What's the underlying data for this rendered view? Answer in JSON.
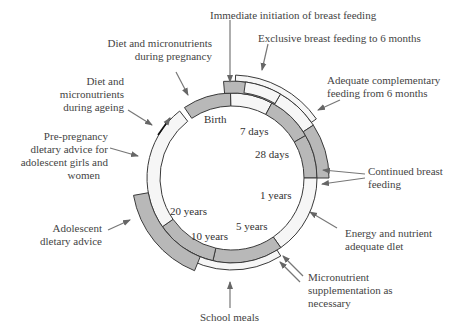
{
  "diagram": {
    "type": "life-cycle ring diagram",
    "center_labels": {
      "birth": "Birth",
      "days7": "7 days",
      "days28": "28 days",
      "years1": "1 years",
      "years5": "5 years",
      "years10": "10 years",
      "years20": "20 years"
    },
    "interventions": {
      "immediate_bf": "Immediate initiation of breast feeding",
      "exclusive_bf": "Exclusive breast feeding to 6 months",
      "complementary_l1": "Adequate complementary",
      "complementary_l2": "feeding from 6 months",
      "continued_bf_l1": "Continued breast",
      "continued_bf_l2": "feeding",
      "energy_l1": "Energy and nutrient",
      "energy_l2": "adequate dlet",
      "micro_supp_l1": "Micronutrient",
      "micro_supp_l2": "supplementation  as",
      "micro_supp_l3": "necessary",
      "school_meals": "School meals",
      "adolescent_l1": "Adolescent",
      "adolescent_l2": "dletary advice",
      "prepreg_l1": "Pre-pregnancy",
      "prepreg_l2": "dletary advice for",
      "prepreg_l3": "adolescent girls and",
      "prepreg_l4": "women",
      "ageing_l1": "Diet and",
      "ageing_l2": "micronutrients",
      "ageing_l3": "during ageing",
      "pregnancy_l1": "Diet and micronutrients",
      "pregnancy_l2": "during pregnancy"
    },
    "colors": {
      "ring_dark": "#b8b8b8",
      "ring_light": "#f6f6f6",
      "stroke": "#3a3a3a",
      "arrow": "#666666"
    }
  }
}
